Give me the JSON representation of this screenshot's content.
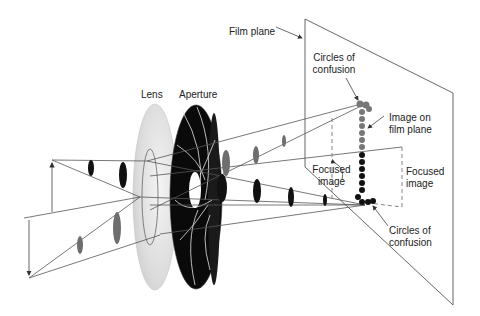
{
  "diagram": {
    "labels": {
      "film_plane": "Film plane",
      "lens": "Lens",
      "aperture": "Aperture",
      "circles_top_1": "Circles of",
      "circles_top_2": "confusion",
      "image_on_1": "Image on",
      "image_on_2": "film plane",
      "focused_left_1": "Focused",
      "focused_left_2": "image",
      "focused_right_1": "Focused",
      "focused_right_2": "image",
      "circles_bottom_1": "Circles of",
      "circles_bottom_2": "confusion"
    },
    "colors": {
      "line": "#444444",
      "dark_ellipse": "#111111",
      "gray_ellipse": "#6e6e6e",
      "lens": "#d9d9d9",
      "aperture": "#0a0a0a",
      "dashed": "#777777"
    }
  }
}
